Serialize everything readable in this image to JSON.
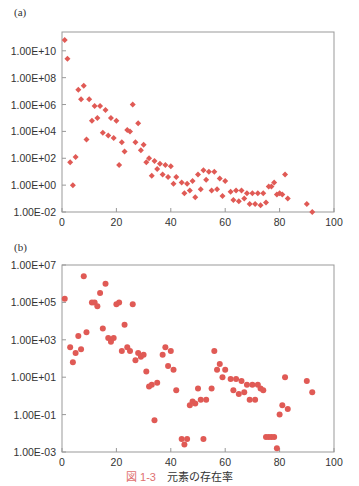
{
  "caption": {
    "figure_number": "図 1-3",
    "title": "元素の存在率"
  },
  "colors": {
    "marker": "#e05a55",
    "axis": "#999999",
    "text": "#333333",
    "caption_accent": "#e0706f"
  },
  "chart_data": [
    {
      "panel": "(a)",
      "type": "scatter",
      "marker": "diamond",
      "xlabel": "",
      "ylabel": "",
      "xlim": [
        0,
        100
      ],
      "xticks": [
        0,
        20,
        40,
        60,
        80,
        100
      ],
      "ylim_log10": [
        -2,
        11.4
      ],
      "yscale": "log",
      "yticks": [
        "1.00E-02",
        "1.00E+00",
        "1.00E+02",
        "1.00E+04",
        "1.00E+06",
        "1.00E+08",
        "1.00E+10"
      ],
      "grid": false,
      "points_log10": [
        [
          1,
          10.8
        ],
        [
          2,
          9.4
        ],
        [
          3,
          1.7
        ],
        [
          4,
          0.0
        ],
        [
          5,
          2.1
        ],
        [
          6,
          7.1
        ],
        [
          7,
          6.4
        ],
        [
          8,
          7.4
        ],
        [
          9,
          3.4
        ],
        [
          10,
          6.4
        ],
        [
          11,
          4.8
        ],
        [
          12,
          5.9
        ],
        [
          13,
          5.0
        ],
        [
          14,
          5.9
        ],
        [
          15,
          3.9
        ],
        [
          16,
          5.6
        ],
        [
          17,
          3.7
        ],
        [
          18,
          5.0
        ],
        [
          19,
          3.5
        ],
        [
          20,
          4.8
        ],
        [
          21,
          1.5
        ],
        [
          22,
          3.2
        ],
        [
          23,
          2.5
        ],
        [
          24,
          4.1
        ],
        [
          25,
          4.0
        ],
        [
          26,
          6.0
        ],
        [
          27,
          3.2
        ],
        [
          28,
          4.6
        ],
        [
          29,
          2.6
        ],
        [
          30,
          3.0
        ],
        [
          31,
          1.7
        ],
        [
          32,
          2.0
        ],
        [
          33,
          0.7
        ],
        [
          34,
          1.8
        ],
        [
          35,
          1.2
        ],
        [
          36,
          1.6
        ],
        [
          37,
          0.8
        ],
        [
          38,
          1.5
        ],
        [
          39,
          0.6
        ],
        [
          40,
          1.4
        ],
        [
          41,
          0.1
        ],
        [
          42,
          0.6
        ],
        [
          44,
          0.2
        ],
        [
          45,
          -0.6
        ],
        [
          46,
          0.1
        ],
        [
          47,
          -0.4
        ],
        [
          48,
          0.3
        ],
        [
          49,
          -0.9
        ],
        [
          50,
          0.8
        ],
        [
          51,
          -0.3
        ],
        [
          52,
          1.1
        ],
        [
          53,
          0.4
        ],
        [
          54,
          1.0
        ],
        [
          55,
          -0.4
        ],
        [
          56,
          1.0
        ],
        [
          57,
          -0.3
        ],
        [
          58,
          0.5
        ],
        [
          59,
          -0.8
        ],
        [
          60,
          0.3
        ],
        [
          62,
          -0.5
        ],
        [
          63,
          -1.1
        ],
        [
          64,
          -0.4
        ],
        [
          65,
          -1.2
        ],
        [
          66,
          -0.4
        ],
        [
          67,
          -1.0
        ],
        [
          68,
          -0.6
        ],
        [
          69,
          -1.4
        ],
        [
          70,
          -0.6
        ],
        [
          71,
          -1.4
        ],
        [
          72,
          -0.6
        ],
        [
          73,
          -1.5
        ],
        [
          74,
          -0.6
        ],
        [
          75,
          -1.3
        ],
        [
          76,
          -0.1
        ],
        [
          77,
          -0.1
        ],
        [
          78,
          0.2
        ],
        [
          79,
          -0.7
        ],
        [
          80,
          -0.6
        ],
        [
          81,
          -0.7
        ],
        [
          82,
          0.8
        ],
        [
          83,
          -1.0
        ],
        [
          90,
          -1.4
        ],
        [
          92,
          -2.0
        ]
      ]
    },
    {
      "panel": "(b)",
      "type": "scatter",
      "marker": "circle",
      "xlabel": "",
      "ylabel": "",
      "xlim": [
        0,
        100
      ],
      "xticks": [
        0,
        20,
        40,
        60,
        80,
        100
      ],
      "ylim_log10": [
        -3,
        7
      ],
      "yscale": "log",
      "yticks": [
        "1.00E-03",
        "1.00E-01",
        "1.00E+01",
        "1.00E+03",
        "1.00E+05",
        "1.00E+07"
      ],
      "grid": false,
      "points_log10": [
        [
          1,
          5.2
        ],
        [
          3,
          2.6
        ],
        [
          4,
          1.8
        ],
        [
          5,
          2.3
        ],
        [
          6,
          3.2
        ],
        [
          7,
          2.5
        ],
        [
          8,
          6.4
        ],
        [
          9,
          3.4
        ],
        [
          11,
          5.0
        ],
        [
          12,
          5.0
        ],
        [
          13,
          4.8
        ],
        [
          14,
          5.5
        ],
        [
          15,
          3.6
        ],
        [
          16,
          6.0
        ],
        [
          17,
          3.1
        ],
        [
          18,
          2.9
        ],
        [
          19,
          3.1
        ],
        [
          20,
          4.9
        ],
        [
          21,
          5.0
        ],
        [
          22,
          2.4
        ],
        [
          23,
          3.8
        ],
        [
          24,
          2.6
        ],
        [
          25,
          2.4
        ],
        [
          26,
          4.9
        ],
        [
          27,
          1.9
        ],
        [
          28,
          2.3
        ],
        [
          29,
          2.1
        ],
        [
          30,
          2.2
        ],
        [
          31,
          1.3
        ],
        [
          32,
          0.5
        ],
        [
          33,
          0.6
        ],
        [
          34,
          -1.3
        ],
        [
          35,
          0.7
        ],
        [
          37,
          2.2
        ],
        [
          38,
          2.6
        ],
        [
          39,
          1.6
        ],
        [
          40,
          2.4
        ],
        [
          41,
          1.4
        ],
        [
          42,
          0.3
        ],
        [
          44,
          -2.3
        ],
        [
          45,
          -2.6
        ],
        [
          46,
          -2.3
        ],
        [
          47,
          -0.5
        ],
        [
          48,
          -0.3
        ],
        [
          49,
          -0.4
        ],
        [
          50,
          0.4
        ],
        [
          51,
          -0.2
        ],
        [
          52,
          -2.3
        ],
        [
          53,
          -0.2
        ],
        [
          55,
          0.4
        ],
        [
          56,
          2.4
        ],
        [
          57,
          1.4
        ],
        [
          58,
          1.7
        ],
        [
          59,
          1.0
        ],
        [
          60,
          1.4
        ],
        [
          62,
          0.9
        ],
        [
          63,
          0.3
        ],
        [
          64,
          0.9
        ],
        [
          65,
          0.1
        ],
        [
          66,
          0.8
        ],
        [
          67,
          0.2
        ],
        [
          68,
          0.6
        ],
        [
          69,
          -0.2
        ],
        [
          70,
          0.6
        ],
        [
          71,
          -0.2
        ],
        [
          72,
          0.6
        ],
        [
          73,
          0.4
        ],
        [
          74,
          0.3
        ],
        [
          75,
          -2.2
        ],
        [
          76,
          -2.2
        ],
        [
          77,
          -2.2
        ],
        [
          78,
          -2.2
        ],
        [
          79,
          -2.8
        ],
        [
          80,
          -1.0
        ],
        [
          81,
          -0.5
        ],
        [
          82,
          1.0
        ],
        [
          83,
          -0.7
        ],
        [
          90,
          0.8
        ],
        [
          92,
          0.2
        ]
      ]
    }
  ]
}
